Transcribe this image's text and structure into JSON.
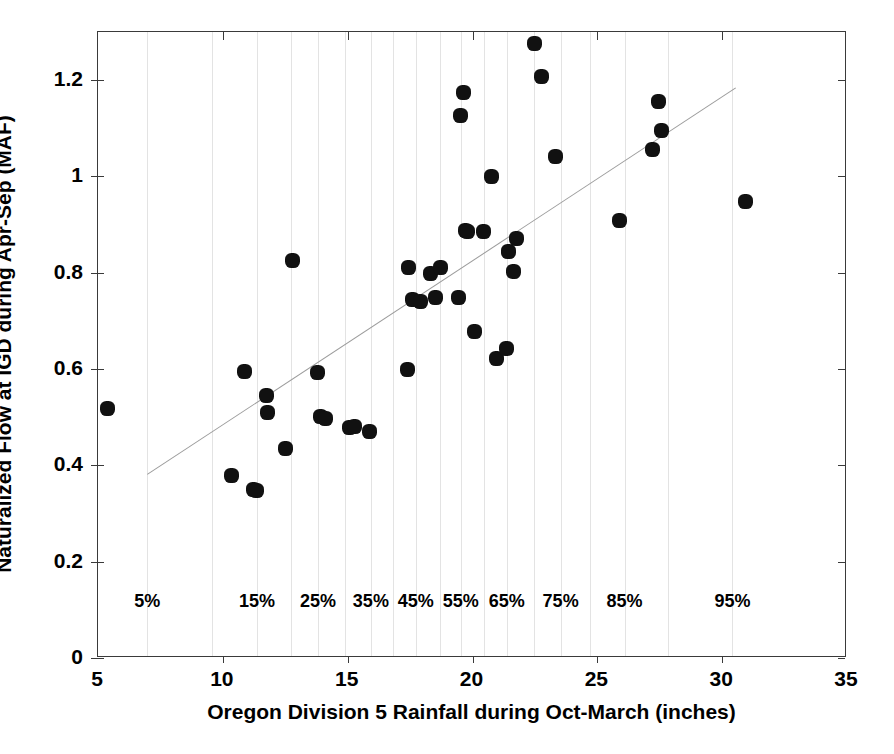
{
  "chart_data": {
    "type": "scatter",
    "title": "",
    "xlabel": "Oregon Division 5 Rainfall during Oct-March (inches)",
    "ylabel": "Naturalized Flow at IGD during Apr-Sep (MAF)",
    "xlim": [
      5,
      35
    ],
    "ylim": [
      0,
      1.3
    ],
    "xticks": [
      5,
      10,
      15,
      20,
      25,
      30,
      35
    ],
    "xtick_labels": [
      "5",
      "10",
      "15",
      "20",
      "25",
      "30",
      "35"
    ],
    "yticks": [
      0,
      0.2,
      0.4,
      0.6,
      0.8,
      1,
      1.2
    ],
    "ytick_labels": [
      "0",
      "0.2",
      "0.4",
      "0.6",
      "0.8",
      "1",
      "1.2"
    ],
    "grid": "vertical-only",
    "legend": "none",
    "marker": "filled-circle",
    "marker_color": "#111111",
    "gridline_color": "#e3e3e3",
    "trendline_color": "#9b9b9b",
    "axis_color": "#3a3a3a",
    "percentile_gridlines": [
      {
        "label": "5%",
        "x": 6.97,
        "labeled": true
      },
      {
        "label": "10%",
        "x": 9.57,
        "labeled": false
      },
      {
        "label": "15%",
        "x": 11.37,
        "labeled": true
      },
      {
        "label": "20%",
        "x": 12.73,
        "labeled": false
      },
      {
        "label": "25%",
        "x": 13.81,
        "labeled": true
      },
      {
        "label": "30%",
        "x": 14.89,
        "labeled": false
      },
      {
        "label": "35%",
        "x": 15.93,
        "labeled": true
      },
      {
        "label": "40%",
        "x": 16.81,
        "labeled": false
      },
      {
        "label": "45%",
        "x": 17.73,
        "labeled": true
      },
      {
        "label": "50%",
        "x": 18.69,
        "labeled": false
      },
      {
        "label": "55%",
        "x": 19.53,
        "labeled": true
      },
      {
        "label": "60%",
        "x": 20.45,
        "labeled": false
      },
      {
        "label": "65%",
        "x": 21.37,
        "labeled": true
      },
      {
        "label": "70%",
        "x": 22.45,
        "labeled": false
      },
      {
        "label": "75%",
        "x": 23.53,
        "labeled": true
      },
      {
        "label": "80%",
        "x": 24.69,
        "labeled": false
      },
      {
        "label": "85%",
        "x": 26.09,
        "labeled": true
      },
      {
        "label": "90%",
        "x": 27.85,
        "labeled": false
      },
      {
        "label": "95%",
        "x": 30.41,
        "labeled": true
      }
    ],
    "percentile_label_y": 0.115,
    "trendline": {
      "x0": 6.97,
      "y0": 0.382,
      "x1": 30.55,
      "y1": 1.185
    },
    "points": [
      {
        "x": 5.38,
        "y": 0.518
      },
      {
        "x": 10.33,
        "y": 0.38
      },
      {
        "x": 10.86,
        "y": 0.594
      },
      {
        "x": 11.22,
        "y": 0.35
      },
      {
        "x": 11.36,
        "y": 0.348
      },
      {
        "x": 11.74,
        "y": 0.545
      },
      {
        "x": 11.8,
        "y": 0.509
      },
      {
        "x": 12.5,
        "y": 0.436
      },
      {
        "x": 12.8,
        "y": 0.826
      },
      {
        "x": 13.78,
        "y": 0.592
      },
      {
        "x": 13.92,
        "y": 0.501
      },
      {
        "x": 14.12,
        "y": 0.497
      },
      {
        "x": 15.08,
        "y": 0.478
      },
      {
        "x": 15.29,
        "y": 0.48
      },
      {
        "x": 15.86,
        "y": 0.471
      },
      {
        "x": 17.38,
        "y": 0.6
      },
      {
        "x": 17.42,
        "y": 0.81
      },
      {
        "x": 17.59,
        "y": 0.745
      },
      {
        "x": 17.9,
        "y": 0.74
      },
      {
        "x": 18.33,
        "y": 0.798
      },
      {
        "x": 18.52,
        "y": 0.748
      },
      {
        "x": 18.72,
        "y": 0.811
      },
      {
        "x": 19.43,
        "y": 0.749
      },
      {
        "x": 19.53,
        "y": 1.126
      },
      {
        "x": 19.62,
        "y": 1.174
      },
      {
        "x": 19.7,
        "y": 0.888
      },
      {
        "x": 19.79,
        "y": 0.885
      },
      {
        "x": 20.08,
        "y": 0.679
      },
      {
        "x": 20.45,
        "y": 0.885
      },
      {
        "x": 20.77,
        "y": 1.0
      },
      {
        "x": 20.95,
        "y": 0.621
      },
      {
        "x": 21.35,
        "y": 0.643
      },
      {
        "x": 21.45,
        "y": 0.845
      },
      {
        "x": 21.63,
        "y": 0.803
      },
      {
        "x": 21.78,
        "y": 0.872
      },
      {
        "x": 22.49,
        "y": 1.277
      },
      {
        "x": 22.77,
        "y": 1.208
      },
      {
        "x": 23.32,
        "y": 1.042
      },
      {
        "x": 25.88,
        "y": 0.908
      },
      {
        "x": 27.19,
        "y": 1.057
      },
      {
        "x": 27.44,
        "y": 1.155
      },
      {
        "x": 27.55,
        "y": 1.096
      },
      {
        "x": 30.93,
        "y": 0.948
      }
    ]
  }
}
